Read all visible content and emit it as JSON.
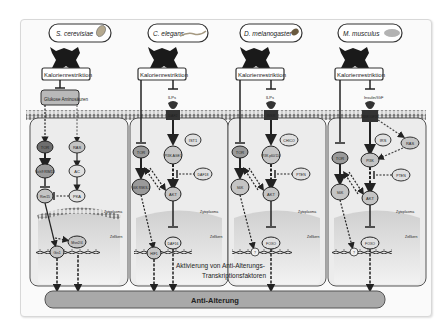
{
  "diagram": {
    "columns": [
      {
        "organism": "S. cerevisiae",
        "organism_icon": "yeast-icon",
        "stimulus": "Kalorienrestriktion",
        "ligand_box": "Glukose Aminosäuren",
        "nodes": [
          "TOR",
          "RAS",
          "Sch9 RIM15",
          "AC",
          "Rim15",
          "PKA"
        ],
        "nuclear_factors": [
          "Gis1",
          "Msn2/4"
        ],
        "cyto_label": "Zytoplasma",
        "nucleus_label": "Zellkern"
      },
      {
        "organism": "C. elegans",
        "organism_icon": "worm-icon",
        "stimulus": "Kalorienrestriktion",
        "ligand": "ILPs",
        "receptor": "DAF2",
        "nodes": [
          "TOR",
          "IST1",
          "PI3K AGE1",
          "DAF18",
          "S6K RSKS-1",
          "AKT"
        ],
        "nuclear_factors": [
          "HIF1",
          "DAF16"
        ],
        "cyto_label": "Zytoplasma",
        "nucleus_label": "Zellkern"
      },
      {
        "organism": "D. melanogaster",
        "organism_icon": "fly-icon",
        "stimulus": "Kalorienrestriktion",
        "ligand": "ILPs",
        "receptor": "INSR",
        "nodes": [
          "TOR",
          "CHICO",
          "PI3K p60/110",
          "PTEN",
          "S6K",
          "AKT"
        ],
        "nuclear_factors": [
          "?",
          "FOXO"
        ],
        "cyto_label": "Zytoplasma",
        "nucleus_label": "Zellkern"
      },
      {
        "organism": "M. musculus",
        "organism_icon": "mouse-icon",
        "stimulus": "Kalorienrestriktion",
        "ligand": "Insulin/IGF",
        "receptor": "INSR IGF1R",
        "nodes": [
          "TOR",
          "IRS",
          "RAS",
          "PI3K",
          "PTEN",
          "S6K",
          "AKT"
        ],
        "nuclear_factors": [
          "?",
          "FOXO"
        ],
        "cyto_label": "Zytoplasma",
        "nucleus_label": "Zellkern"
      }
    ],
    "center_caption_line1": "Aktivierung von Anti-Alterungs-",
    "center_caption_line2": "Transkriptionsfaktoren",
    "bottom_bar": "Anti-Alterung",
    "colors": {
      "panel": "#e9e9e9",
      "node": "#c8c8c8",
      "node_dark": "#6e6e6e",
      "bar": "#a9a9a9",
      "outline": "#333333"
    }
  }
}
